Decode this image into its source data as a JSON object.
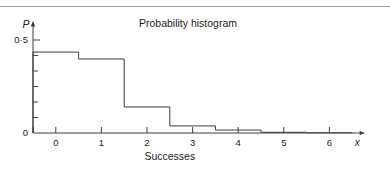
{
  "figure": {
    "top_rule": true,
    "background_color": "#ffffff",
    "line_color": "#3c3c3c",
    "text_color": "#1a1a1a"
  },
  "chart_data": {
    "type": "bar",
    "title": "Probability histogram",
    "xlabel": "Successes",
    "ylabel": "P",
    "x_axis_variable": "x",
    "categories": [
      "0",
      "1",
      "2",
      "3",
      "4",
      "5",
      "6"
    ],
    "values": [
      0.435,
      0.398,
      0.14,
      0.038,
      0.016,
      0.004,
      0.001
    ],
    "xtick_labels": [
      "0",
      "1",
      "2",
      "3",
      "4",
      "5",
      "6"
    ],
    "ytick_labels": [
      "0",
      "0·5"
    ],
    "ytick_values": [
      0,
      0.5
    ],
    "y_minor_ticks": [
      0.0833,
      0.1667,
      0.25,
      0.3333,
      0.4167
    ],
    "xlim": [
      -0.5,
      6.5
    ],
    "ylim": [
      0,
      0.58
    ],
    "grid": false,
    "legend": null,
    "bar_width": 1,
    "bar_fill": "none",
    "axis_arrows": [
      "x",
      "y"
    ]
  }
}
